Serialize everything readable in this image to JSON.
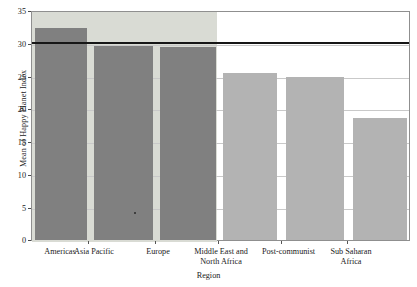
{
  "chart_data": {
    "type": "bar",
    "title": "",
    "xlabel": "Region",
    "ylabel": "Mean of Happy Planet Index",
    "categories": [
      "Americas",
      "Asia Pacific",
      "Europe",
      "Middle East and\nNorth Africa",
      "Post-communist",
      "Sub Saharan\nAfrica"
    ],
    "values": [
      32.6,
      29.8,
      29.7,
      25.7,
      25.1,
      18.7
    ],
    "ylim": [
      0,
      35
    ],
    "yticks": [
      0,
      5,
      10,
      15,
      20,
      25,
      30,
      35
    ],
    "ytick_labels": [
      "0",
      "5",
      "10",
      "15",
      "20",
      "25",
      "30",
      "35"
    ],
    "grid": true,
    "legend": "none",
    "reference_line": {
      "value": 30.4,
      "label": "",
      "color": "#161616"
    },
    "bar_colors": [
      "#808080",
      "#808080",
      "#808080",
      "#b3b3b3",
      "#b3b3b3",
      "#b3b3b3"
    ],
    "panel_shade_color": "#d9dbd4",
    "plot_background": "#ffffff"
  },
  "axes": {
    "y_title": "Mean of Happy Planet Index",
    "x_title": "Region",
    "y_tick_labels": [
      "35",
      "30",
      "25",
      "20",
      "15",
      "10",
      "5",
      "0"
    ]
  },
  "x_labels": [
    {
      "line1": "Americas",
      "line2": ""
    },
    {
      "line1": "Asia Pacific",
      "line2": ""
    },
    {
      "line1": "Europe",
      "line2": ""
    },
    {
      "line1": "Middle East and",
      "line2": "North Africa"
    },
    {
      "line1": "Post-communist",
      "line2": ""
    },
    {
      "line1": "Sub Saharan",
      "line2": "Africa"
    }
  ]
}
